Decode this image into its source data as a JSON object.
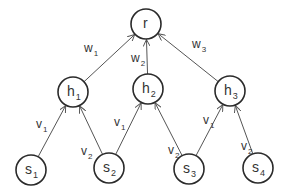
{
  "diagram": {
    "type": "directed-graph",
    "nodes": [
      {
        "id": "r",
        "base": "r",
        "sub": "",
        "x": 146,
        "y": 24
      },
      {
        "id": "h1",
        "base": "h",
        "sub": "1",
        "x": 73,
        "y": 92
      },
      {
        "id": "h2",
        "base": "h",
        "sub": "2",
        "x": 148,
        "y": 89
      },
      {
        "id": "h3",
        "base": "h",
        "sub": "3",
        "x": 230,
        "y": 91
      },
      {
        "id": "s1",
        "base": "s",
        "sub": "1",
        "x": 31,
        "y": 170
      },
      {
        "id": "s2",
        "base": "s",
        "sub": "2",
        "x": 109,
        "y": 168
      },
      {
        "id": "s3",
        "base": "s",
        "sub": "3",
        "x": 189,
        "y": 169
      },
      {
        "id": "s4",
        "base": "s",
        "sub": "4",
        "x": 258,
        "y": 168
      }
    ],
    "edges": [
      {
        "from": "h1",
        "to": "r",
        "label_base": "w",
        "label_sub": "1",
        "lx": 84,
        "ly": 52
      },
      {
        "from": "h2",
        "to": "r",
        "label_base": "w",
        "label_sub": "2",
        "lx": 131,
        "ly": 62
      },
      {
        "from": "h3",
        "to": "r",
        "label_base": "w",
        "label_sub": "3",
        "lx": 192,
        "ly": 48
      },
      {
        "from": "s1",
        "to": "h1",
        "label_base": "v",
        "label_sub": "1",
        "lx": 36,
        "ly": 128
      },
      {
        "from": "s2",
        "to": "h1",
        "label_base": "v",
        "label_sub": "2",
        "lx": 81,
        "ly": 155
      },
      {
        "from": "s2",
        "to": "h2",
        "label_base": "v",
        "label_sub": "1",
        "lx": 114,
        "ly": 126
      },
      {
        "from": "s3",
        "to": "h2",
        "label_base": "v",
        "label_sub": "2",
        "lx": 168,
        "ly": 154
      },
      {
        "from": "s3",
        "to": "h3",
        "label_base": "v",
        "label_sub": "1",
        "lx": 203,
        "ly": 124
      },
      {
        "from": "s4",
        "to": "h3",
        "label_base": "v",
        "label_sub": "2",
        "lx": 241,
        "ly": 150
      }
    ],
    "node_radius": 15,
    "colors": {
      "node_stroke": "#2a2a2a",
      "edge": "#555555",
      "text": "#333333",
      "background": "#ffffff"
    }
  }
}
